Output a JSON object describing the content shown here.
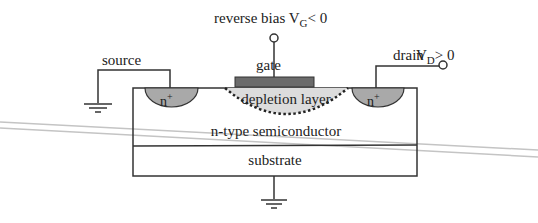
{
  "diagram": {
    "labels": {
      "gate_bias": "reverse bias V",
      "gate_bias_sub": "G",
      "gate_bias_rel": "< 0",
      "gate": "gate",
      "source": "source",
      "drain": "drain",
      "drain_v": "V",
      "drain_v_sub": "D",
      "drain_v_rel": "> 0",
      "source_region": "n",
      "source_region_sup": "+",
      "drain_region": "n",
      "drain_region_sup": "+",
      "depletion": "depletion layer",
      "channel": "n-type semiconductor",
      "substrate": "substrate"
    },
    "colors": {
      "line": "#333333",
      "gate_fill": "#6b6b6b",
      "nplus_fill": "#a9a9a9",
      "depletion_fill": "#dcdcdc",
      "artifact": "#bdbdbd"
    }
  }
}
